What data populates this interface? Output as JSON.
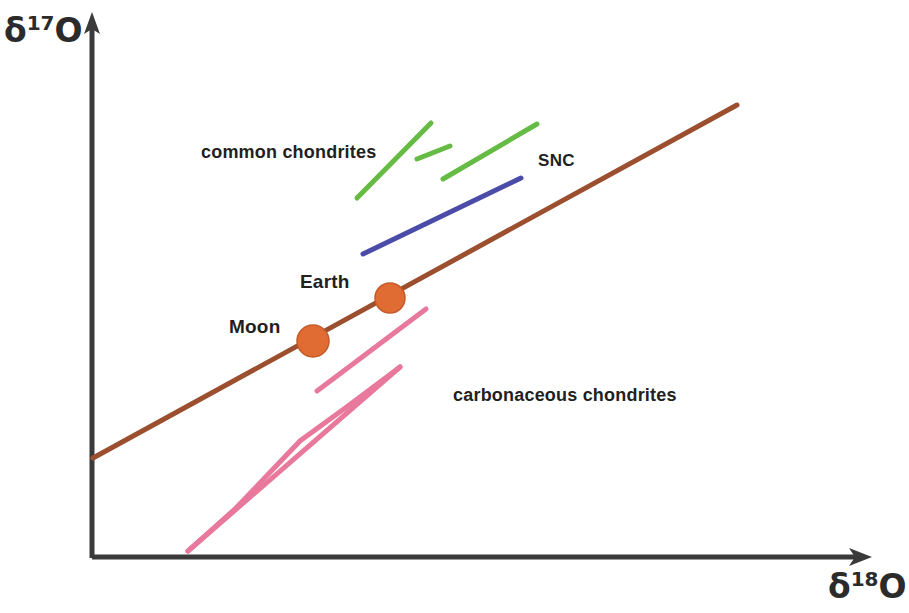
{
  "figure": {
    "background_color": "#ffffff",
    "axis_color": "#3a3a3a"
  },
  "axes": {
    "y_title_symbol": "δ",
    "y_title_sup": "17",
    "y_title_element": "O",
    "x_title_symbol": "δ",
    "x_title_sup": "18",
    "x_title_element": "O",
    "y_axis_name": "delta-17-O",
    "x_axis_name": "delta-18-O",
    "grid": "off",
    "ticks": "none"
  },
  "labels": {
    "common_chondrites": "common chondrites",
    "snc": "SNC",
    "earth": "Earth",
    "moon": "Moon",
    "carbonaceous_chondrites": "carbonaceous chondrites"
  },
  "chart_data": {
    "type": "line",
    "title": "",
    "subtitle": "",
    "xlabel": "δ18O",
    "ylabel": "δ17O",
    "xlim": [
      0,
      100
    ],
    "ylim": [
      0,
      100
    ],
    "grid": false,
    "legend": "inline-annotations",
    "series": [
      {
        "name": "terrestrial fractionation line",
        "color": "#9B4F2E",
        "style": "solid",
        "width": 5,
        "segments": [
          {
            "x1": 93,
            "y1": 458,
            "x2": 737,
            "y2": 105
          }
        ],
        "markers": [
          {
            "label": "Moon",
            "x": 313,
            "y": 341,
            "r": 16,
            "color": "#E06C33"
          },
          {
            "label": "Earth",
            "x": 390,
            "y": 298,
            "r": 15,
            "color": "#E06C33"
          }
        ]
      },
      {
        "name": "common chondrites",
        "color": "#66BB44",
        "style": "solid",
        "width": 5,
        "segments": [
          {
            "x1": 357,
            "y1": 198,
            "x2": 431,
            "y2": 123
          },
          {
            "x1": 417,
            "y1": 159,
            "x2": 450,
            "y2": 146
          },
          {
            "x1": 443,
            "y1": 179,
            "x2": 537,
            "y2": 124
          }
        ]
      },
      {
        "name": "SNC",
        "color": "#4B4BA8",
        "style": "solid",
        "width": 5,
        "segments": [
          {
            "x1": 363,
            "y1": 254,
            "x2": 521,
            "y2": 178
          }
        ]
      },
      {
        "name": "carbonaceous chondrites",
        "color": "#E8799C",
        "style": "solid",
        "width": 5,
        "segments": [
          {
            "x1": 317,
            "y1": 391,
            "x2": 426,
            "y2": 309
          },
          {
            "x1": 188,
            "y1": 551,
            "x2": 400,
            "y2": 367
          },
          {
            "x1": 424,
            "y1": 375,
            "x2": 609,
            "y2": 259
          }
        ]
      }
    ]
  }
}
